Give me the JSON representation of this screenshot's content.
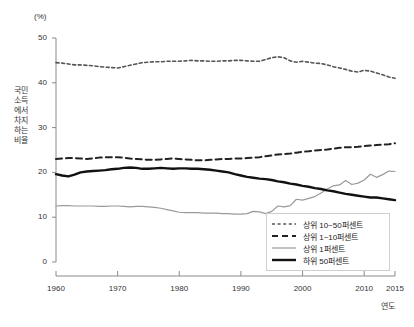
{
  "chart_data": {
    "type": "line",
    "title": "",
    "xlabel": "연도",
    "ylabel": "국민소득에서 차지하는 비율",
    "unit_label": "(%)",
    "xlim": [
      1960,
      2015
    ],
    "ylim": [
      0,
      50
    ],
    "grid": false,
    "legend_position": "bottom-right",
    "xticks": [
      "1960",
      "1970",
      "1980",
      "1990",
      "2000",
      "2010",
      "2015"
    ],
    "xtick_values": [
      1960,
      1970,
      1980,
      1990,
      2000,
      2010,
      2015
    ],
    "yticks": [
      "0",
      "10",
      "20",
      "30",
      "40",
      "50"
    ],
    "ytick_values": [
      0,
      10,
      20,
      30,
      40,
      50
    ],
    "x": [
      1960,
      1961,
      1962,
      1963,
      1964,
      1965,
      1966,
      1967,
      1968,
      1969,
      1970,
      1971,
      1972,
      1973,
      1974,
      1975,
      1976,
      1977,
      1978,
      1979,
      1980,
      1981,
      1982,
      1983,
      1984,
      1985,
      1986,
      1987,
      1988,
      1989,
      1990,
      1991,
      1992,
      1993,
      1994,
      1995,
      1996,
      1997,
      1998,
      1999,
      2000,
      2001,
      2002,
      2003,
      2004,
      2005,
      2006,
      2007,
      2008,
      2009,
      2010,
      2011,
      2012,
      2013,
      2014,
      2015
    ],
    "series": [
      {
        "name": "상위 10~50퍼센트",
        "style": "short-dash",
        "color": "#555555",
        "width": 1.6,
        "values": [
          44.5,
          44.4,
          44.2,
          44.0,
          44.0,
          43.9,
          43.8,
          43.6,
          43.5,
          43.4,
          43.3,
          43.6,
          43.9,
          44.2,
          44.5,
          44.6,
          44.7,
          44.7,
          44.8,
          44.8,
          44.8,
          44.9,
          45.0,
          44.9,
          44.9,
          44.8,
          44.8,
          44.9,
          44.9,
          45.0,
          45.0,
          44.9,
          44.8,
          44.8,
          45.2,
          45.6,
          45.8,
          45.6,
          44.9,
          44.6,
          44.8,
          44.6,
          44.4,
          44.3,
          44.0,
          43.6,
          43.3,
          43.0,
          42.6,
          42.4,
          42.8,
          42.6,
          42.2,
          41.8,
          41.3,
          41.0
        ]
      },
      {
        "name": "상위 1~10퍼센트",
        "style": "long-dash",
        "color": "#222222",
        "width": 2.0,
        "values": [
          23.0,
          23.1,
          23.2,
          23.2,
          23.1,
          23.0,
          23.1,
          23.3,
          23.4,
          23.4,
          23.4,
          23.3,
          23.1,
          23.0,
          22.9,
          22.8,
          22.8,
          22.9,
          23.0,
          23.1,
          23.0,
          22.9,
          22.8,
          22.7,
          22.7,
          22.8,
          22.9,
          23.0,
          23.0,
          23.1,
          23.1,
          23.2,
          23.3,
          23.4,
          23.6,
          23.8,
          24.0,
          24.1,
          24.2,
          24.4,
          24.6,
          24.7,
          24.9,
          25.0,
          25.1,
          25.3,
          25.5,
          25.6,
          25.6,
          25.7,
          25.9,
          26.0,
          26.1,
          26.2,
          26.3,
          26.5
        ]
      },
      {
        "name": "상위 1퍼센트",
        "style": "solid-thin",
        "color": "#9a9a9a",
        "width": 1.2,
        "values": [
          12.5,
          12.6,
          12.6,
          12.5,
          12.5,
          12.5,
          12.5,
          12.4,
          12.4,
          12.5,
          12.5,
          12.4,
          12.3,
          12.4,
          12.4,
          12.3,
          12.2,
          12.0,
          11.7,
          11.4,
          11.1,
          11.0,
          11.0,
          11.0,
          10.9,
          10.9,
          10.9,
          10.8,
          10.8,
          10.7,
          10.7,
          10.8,
          11.3,
          11.2,
          10.8,
          11.3,
          12.5,
          12.3,
          12.6,
          14.0,
          13.8,
          14.2,
          14.6,
          15.4,
          16.3,
          17.0,
          17.2,
          18.2,
          17.3,
          17.6,
          18.3,
          19.6,
          18.9,
          19.5,
          20.3,
          20.2
        ]
      },
      {
        "name": "하위 50퍼센트",
        "style": "solid-thick",
        "color": "#111111",
        "width": 2.4,
        "values": [
          19.6,
          19.3,
          19.1,
          19.5,
          20.0,
          20.2,
          20.3,
          20.4,
          20.5,
          20.7,
          20.8,
          21.0,
          21.1,
          21.0,
          20.8,
          20.8,
          20.9,
          21.0,
          20.9,
          20.8,
          20.9,
          20.9,
          20.8,
          20.8,
          20.7,
          20.6,
          20.4,
          20.2,
          20.0,
          19.6,
          19.3,
          19.0,
          18.8,
          18.6,
          18.5,
          18.3,
          18.0,
          17.8,
          17.5,
          17.3,
          17.0,
          16.8,
          16.5,
          16.3,
          16.0,
          15.8,
          15.5,
          15.2,
          15.0,
          14.8,
          14.6,
          14.4,
          14.4,
          14.2,
          14.0,
          13.8
        ]
      }
    ]
  },
  "legend": {
    "items": [
      {
        "label": "상위 10~50퍼센트"
      },
      {
        "label": "상위 1~10퍼센트"
      },
      {
        "label": "상위 1퍼센트"
      },
      {
        "label": "하위 50퍼센트"
      }
    ]
  }
}
